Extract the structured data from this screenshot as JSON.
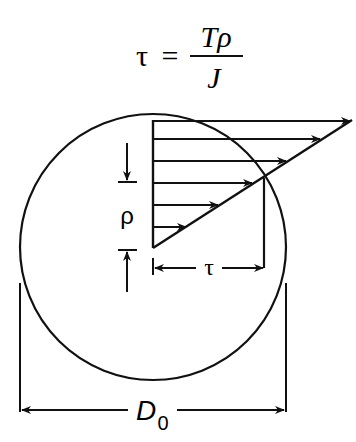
{
  "formula": {
    "lhs": "τ",
    "equals": "=",
    "numerator": "Tρ",
    "denominator": "J"
  },
  "labels": {
    "rho": "ρ",
    "tau": "τ",
    "diameter_main": "D",
    "diameter_sub": "0"
  },
  "colors": {
    "stroke": "#111111",
    "background": "#ffffff"
  }
}
